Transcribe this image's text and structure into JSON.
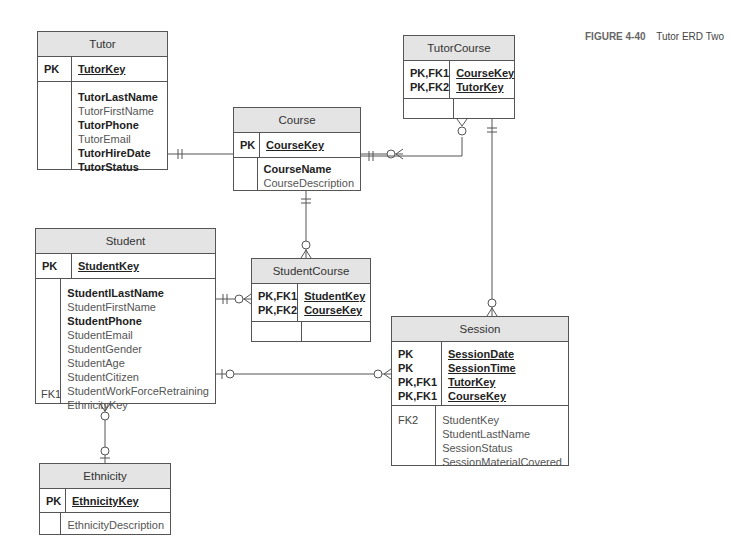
{
  "caption": {
    "figure": "FIGURE 4-40",
    "title": "Tutor ERD Two"
  },
  "entities": {
    "tutor": {
      "name": "Tutor",
      "pk_keys": [
        "PK"
      ],
      "pk_attrs": [
        "TutorKey"
      ],
      "fk_keys": [],
      "attrs": [
        {
          "name": "TutorLastName",
          "required": true
        },
        {
          "name": "TutorFirstName",
          "required": false
        },
        {
          "name": "TutorPhone",
          "required": true
        },
        {
          "name": "TutorEmail",
          "required": false
        },
        {
          "name": "TutorHireDate",
          "required": true
        },
        {
          "name": "TutorStatus",
          "required": true
        }
      ]
    },
    "tutorcourse": {
      "name": "TutorCourse",
      "pk_keys": [
        "PK,FK1",
        "PK,FK2"
      ],
      "pk_attrs": [
        "CourseKey",
        "TutorKey"
      ],
      "attrs": []
    },
    "course": {
      "name": "Course",
      "pk_keys": [
        "PK"
      ],
      "pk_attrs": [
        "CourseKey"
      ],
      "attrs": [
        {
          "name": "CourseName",
          "required": true
        },
        {
          "name": "CourseDescription",
          "required": false
        }
      ]
    },
    "student": {
      "name": "Student",
      "pk_keys": [
        "PK"
      ],
      "pk_attrs": [
        "StudentKey"
      ],
      "fk_label": "FK1",
      "attrs": [
        {
          "name": "StudentlLastName",
          "required": true
        },
        {
          "name": "StudentFirstName",
          "required": false
        },
        {
          "name": "StudentPhone",
          "required": true
        },
        {
          "name": "StudentEmail",
          "required": false
        },
        {
          "name": "StudentGender",
          "required": false
        },
        {
          "name": "StudentAge",
          "required": false
        },
        {
          "name": "StudentCitizen",
          "required": false
        },
        {
          "name": "StudentWorkForceRetraining",
          "required": false
        },
        {
          "name": "EthnicityKey",
          "required": false
        }
      ]
    },
    "studentcourse": {
      "name": "StudentCourse",
      "pk_keys": [
        "PK,FK1",
        "PK,FK2"
      ],
      "pk_attrs": [
        "StudentKey",
        "CourseKey"
      ],
      "attrs": []
    },
    "session": {
      "name": "Session",
      "pk_keys": [
        "PK",
        "PK",
        "PK,FK1",
        "PK,FK1"
      ],
      "pk_attrs": [
        "SessionDate",
        "SessionTime",
        "TutorKey",
        "CourseKey"
      ],
      "fk_label": "FK2",
      "attrs": [
        {
          "name": "StudentKey",
          "required": false
        },
        {
          "name": "StudentLastName",
          "required": false
        },
        {
          "name": "SessionStatus",
          "required": false
        },
        {
          "name": "SessionMaterialCovered",
          "required": false
        }
      ]
    },
    "ethnicity": {
      "name": "Ethnicity",
      "pk_keys": [
        "PK"
      ],
      "pk_attrs": [
        "EthnicityKey"
      ],
      "attrs": [
        {
          "name": "EthnicityDescription",
          "required": false
        }
      ]
    }
  },
  "relationships": [
    {
      "from": "Tutor",
      "to": "TutorCourse",
      "from_card": "one-and-only-one",
      "to_card": "zero-or-many"
    },
    {
      "from": "Course",
      "to": "TutorCourse",
      "from_card": "one-and-only-one",
      "to_card": "zero-or-many"
    },
    {
      "from": "TutorCourse",
      "to": "Session",
      "from_card": "one-and-only-one",
      "to_card": "zero-or-many"
    },
    {
      "from": "Course",
      "to": "StudentCourse",
      "from_card": "one-and-only-one",
      "to_card": "zero-or-many"
    },
    {
      "from": "Student",
      "to": "StudentCourse",
      "from_card": "one-and-only-one",
      "to_card": "zero-or-many"
    },
    {
      "from": "Student",
      "to": "Session",
      "from_card": "zero-or-one",
      "to_card": "zero-or-many"
    },
    {
      "from": "Ethnicity",
      "to": "Student",
      "from_card": "zero-or-one",
      "to_card": "zero-or-many"
    }
  ]
}
